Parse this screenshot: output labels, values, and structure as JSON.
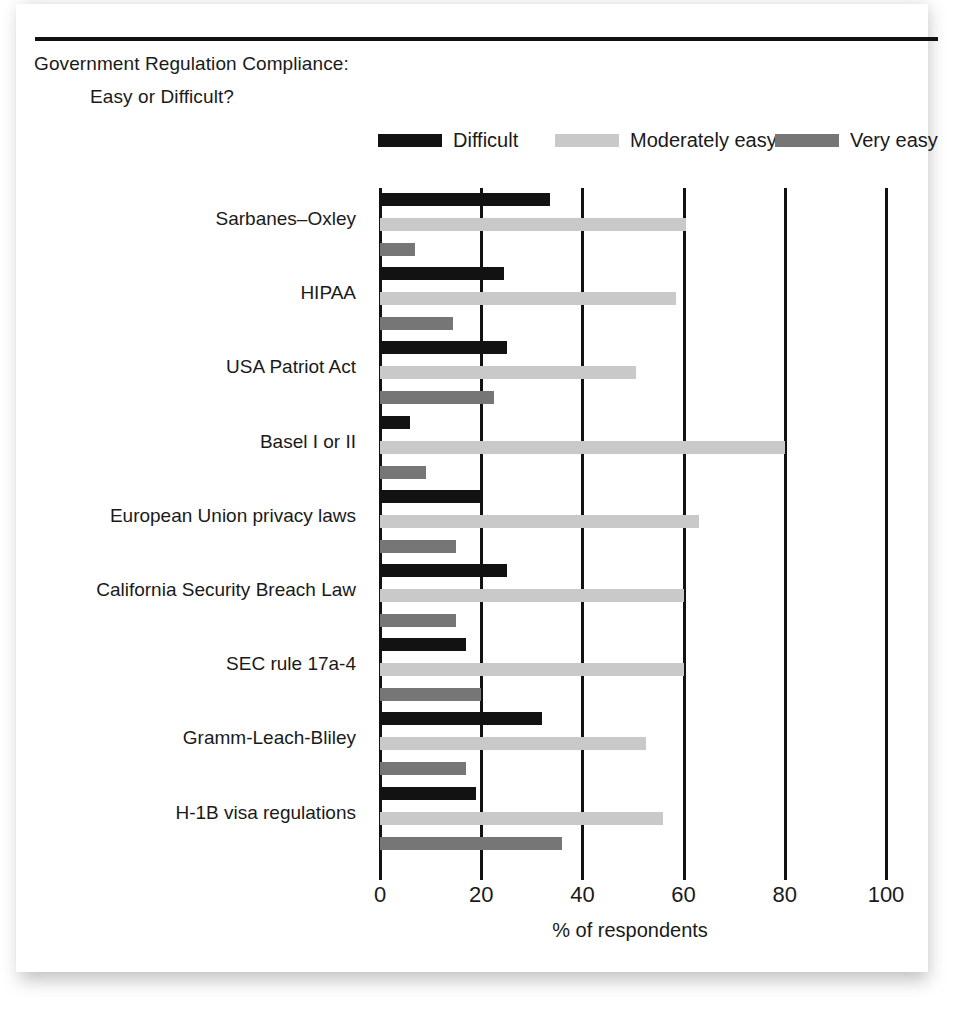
{
  "title": {
    "line_1": "Government Regulation Compliance:",
    "line_2": "Easy or Difficult?"
  },
  "chart_data": {
    "type": "bar",
    "orientation": "horizontal",
    "grouped": true,
    "title": "Government Regulation Compliance: Easy or Difficult?",
    "xlabel": "% of respondents",
    "ylabel": "",
    "xlim": [
      0,
      100
    ],
    "xticks": [
      0,
      20,
      40,
      60,
      80,
      100
    ],
    "xtick_labels": [
      "0",
      "20",
      "40",
      "60",
      "80",
      "100"
    ],
    "grid": "vertical",
    "legend_position": "top",
    "categories": [
      "Sarbanes–Oxley",
      "HIPAA",
      "USA Patriot Act",
      "Basel I or II",
      "European Union privacy laws",
      "California Security Breach Law",
      "SEC rule 17a-4",
      "Gramm-Leach-Bliley",
      "H-1B visa regulations"
    ],
    "series": [
      {
        "name": "Difficult",
        "color": "#121212",
        "values": [
          33.5,
          24.5,
          25,
          6,
          20,
          25,
          17,
          32,
          19
        ]
      },
      {
        "name": "Moderately easy",
        "color": "#c9c9c9",
        "values": [
          60.5,
          58.5,
          50.5,
          80,
          63,
          60,
          60,
          52.5,
          56
        ]
      },
      {
        "name": "Very easy",
        "color": "#767676",
        "values": [
          7,
          14.5,
          22.5,
          9,
          15,
          15,
          20,
          17,
          36
        ]
      }
    ]
  }
}
